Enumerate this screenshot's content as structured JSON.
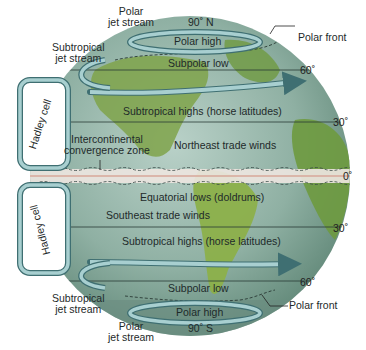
{
  "diagram": {
    "type": "global-atmospheric-circulation",
    "poles": {
      "north": "90˚ N",
      "south": "90˚ S"
    },
    "latitudes": {
      "n60": "60˚",
      "n30": "30˚",
      "equator": "0˚",
      "s30": "30˚",
      "s60": "60˚"
    },
    "jet_streams": {
      "polar_north": [
        "Polar",
        "jet stream"
      ],
      "subtropical_north": [
        "Subtropical",
        "jet stream"
      ],
      "subtropical_south": [
        "Subtropical",
        "jet stream"
      ],
      "polar_south": [
        "Polar",
        "jet stream"
      ]
    },
    "fronts": {
      "north": "Polar front",
      "south": "Polar front"
    },
    "zones": {
      "polar_high_north": "Polar high",
      "subpolar_low_north": "Subpolar low",
      "subtropical_highs_north": "Subtropical highs (horse latitudes)",
      "northeast_trades": "Northeast trade winds",
      "itcz": [
        "Intercontinental",
        "convergence zone"
      ],
      "equatorial_lows": "Equatorial lows (doldrums)",
      "southeast_trades": "Southeast trade winds",
      "subtropical_highs_south": "Subtropical highs (horse latitudes)",
      "subpolar_low_south": "Subpolar low",
      "polar_high_south": "Polar high"
    },
    "cells": {
      "north": "Hadley cell",
      "south": "Hadley cell"
    },
    "colors": {
      "ocean": "#8fb3a8",
      "land": "#7fa34a",
      "arrow_fill": "#9cc3c6",
      "arrow_stroke": "#3f6f72",
      "equator_band": "#ede6e0",
      "equator_line": "#d7a79a",
      "line": "#2a3a35"
    }
  }
}
